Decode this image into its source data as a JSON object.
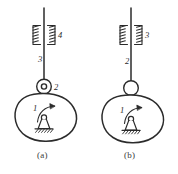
{
  "figure": {
    "title": "",
    "background_color": "#ffffff",
    "line_color": "#2b2b2b",
    "panels": [
      {
        "caption": "(a)",
        "description": "cam mechanism with roller follower in prismatic guide",
        "links": [
          {
            "number": "1",
            "part": "cam"
          },
          {
            "number": "2",
            "part": "roller"
          },
          {
            "number": "3",
            "part": "follower-rod"
          },
          {
            "number": "4",
            "part": "prismatic-guide-frame"
          }
        ],
        "joint_style": "roller-with-pin",
        "rotation_arrow": "clockwise"
      },
      {
        "caption": "(b)",
        "description": "cam mechanism with mushroom follower in prismatic guide",
        "links": [
          {
            "number": "1",
            "part": "cam"
          },
          {
            "number": "2",
            "part": "follower-rod"
          },
          {
            "number": "3",
            "part": "prismatic-guide-frame"
          }
        ],
        "joint_style": "plain-circle",
        "rotation_arrow": "clockwise"
      }
    ]
  }
}
